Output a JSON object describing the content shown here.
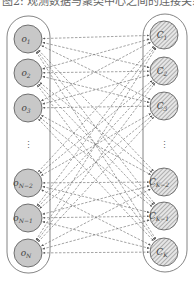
{
  "diagram": {
    "cropped_top_text": "图2: 观测数据与聚类中心之间的连接关系示意图",
    "left_group": {
      "name": "observations",
      "fill": "#c8c8c8",
      "nodes": [
        {
          "label": "o",
          "sub": "1",
          "cy": 39
        },
        {
          "label": "o",
          "sub": "2",
          "cy": 73
        },
        {
          "label": "o",
          "sub": "3",
          "cy": 108
        },
        {
          "label": "o",
          "sub": "N−2",
          "cy": 183
        },
        {
          "label": "o",
          "sub": "N−1",
          "cy": 218
        },
        {
          "label": "o",
          "sub": "N",
          "cy": 253
        }
      ],
      "ellipsis": "⋮"
    },
    "right_group": {
      "name": "clusters",
      "fill": "hatched",
      "nodes": [
        {
          "label": "C",
          "sub": "1",
          "cy": 35
        },
        {
          "label": "C",
          "sub": "2",
          "cy": 71
        },
        {
          "label": "C",
          "sub": "3",
          "cy": 106
        },
        {
          "label": "C",
          "sub": "K−2",
          "cy": 182
        },
        {
          "label": "C",
          "sub": "K−1",
          "cy": 216
        },
        {
          "label": "C",
          "sub": "K",
          "cy": 252
        }
      ],
      "ellipsis": "⋮"
    },
    "edges": "every left node connected to every right node with dashed bidirectional arrows",
    "colors": {
      "stroke": "#555555",
      "node_fill": "#c8c8c8",
      "edge": "#666666"
    }
  }
}
